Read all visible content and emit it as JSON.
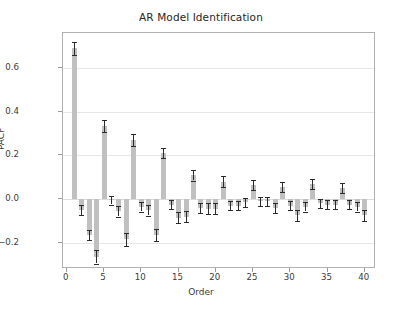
{
  "chart_data": {
    "type": "bar",
    "title": "AR Model Identification",
    "xlabel": "Order",
    "ylabel": "PACF",
    "xlim": [
      -0.5,
      41.5
    ],
    "ylim": [
      -0.32,
      0.76
    ],
    "yticks": [
      0.6,
      0.4,
      0.2,
      0.0,
      -0.2
    ],
    "ytick_labels": [
      "0.6",
      "0.4",
      "0.2",
      "0.0",
      "−0.2"
    ],
    "xticks": [
      0,
      5,
      10,
      15,
      20,
      25,
      30,
      35,
      40
    ],
    "xtick_labels": [
      "0",
      "5",
      "10",
      "15",
      "20",
      "25",
      "30",
      "35",
      "40"
    ],
    "grid": true,
    "legend": null,
    "bar_color": "#c0c0c0",
    "error_color": "#2b2b2b",
    "series_name": "PACF",
    "x": [
      1,
      2,
      3,
      4,
      5,
      6,
      7,
      8,
      9,
      10,
      11,
      12,
      13,
      14,
      15,
      16,
      17,
      18,
      19,
      20,
      21,
      22,
      23,
      24,
      25,
      26,
      27,
      28,
      29,
      30,
      31,
      32,
      33,
      34,
      35,
      36,
      37,
      38,
      39,
      40
    ],
    "values": [
      0.69,
      -0.05,
      -0.165,
      -0.265,
      0.335,
      -0.005,
      -0.055,
      -0.185,
      0.27,
      -0.035,
      -0.05,
      -0.165,
      0.21,
      -0.025,
      -0.085,
      -0.08,
      0.11,
      -0.04,
      -0.045,
      -0.045,
      0.08,
      -0.03,
      -0.03,
      -0.015,
      0.065,
      -0.01,
      -0.01,
      -0.04,
      0.055,
      -0.03,
      -0.075,
      -0.035,
      0.07,
      -0.02,
      -0.025,
      -0.025,
      0.05,
      -0.025,
      -0.035,
      -0.075
    ],
    "errors": [
      0.03,
      0.022,
      0.022,
      0.03,
      0.027,
      0.02,
      0.025,
      0.03,
      0.027,
      0.022,
      0.025,
      0.027,
      0.022,
      0.022,
      0.025,
      0.025,
      0.025,
      0.022,
      0.025,
      0.025,
      0.025,
      0.022,
      0.022,
      0.022,
      0.022,
      0.02,
      0.022,
      0.022,
      0.022,
      0.022,
      0.025,
      0.022,
      0.022,
      0.02,
      0.022,
      0.02,
      0.022,
      0.02,
      0.022,
      0.025
    ]
  }
}
